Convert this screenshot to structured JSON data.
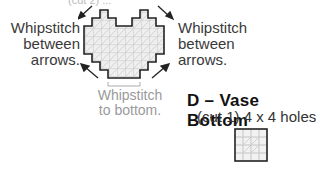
{
  "top_fragment": "(cut 2) ...",
  "heart_piece": {
    "left_label": [
      "Whipstitch",
      "between",
      "arrows."
    ],
    "right_label": [
      "Whipstitch",
      "between",
      "arrows."
    ],
    "bottom_label": [
      "Whipstitch",
      "to bottom."
    ]
  },
  "vase_bottom": {
    "title": "D – Vase Bottom",
    "subtitle": "(cut 1) 4 x 4 holes",
    "grid": {
      "cols": 4,
      "rows": 4
    }
  },
  "colors": {
    "outline": "#222222",
    "grid": "#c8c8c8",
    "fill": "#eeeeee",
    "grey_text": "#9a9a9a"
  }
}
